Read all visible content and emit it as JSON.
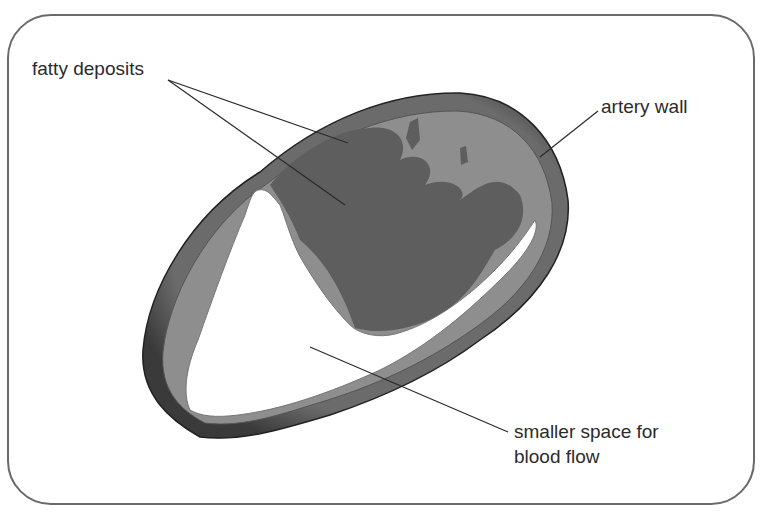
{
  "diagram": {
    "labels": {
      "fatty_deposits": "fatty deposits",
      "artery_wall": "artery wall",
      "blood_flow_line1": "smaller space for",
      "blood_flow_line2": "blood flow"
    },
    "colors": {
      "frame": "#6a6a6a",
      "outer_wall": "#4a4a4a",
      "inner_wall": "#8c8c8c",
      "fatty_deposit": "#5e5e5e",
      "lumen": "#ffffff",
      "leader_line": "#2b2b2b",
      "text": "#2b2b2b"
    }
  }
}
